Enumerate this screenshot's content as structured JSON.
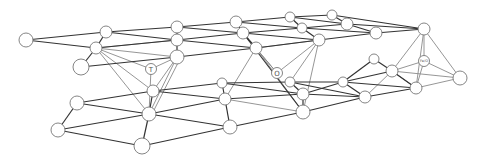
{
  "diagram": {
    "type": "3d-lattice-graph",
    "colors": {
      "background": "#ffffff",
      "edge_dark": "#333333",
      "edge_light": "#8a8a8a",
      "node_stroke": "#777777",
      "node_fill": "#ffffff"
    },
    "labels": {
      "node_T": "T",
      "node_O": "O",
      "node_right": "Fe/O"
    },
    "nodes": [
      {
        "id": "u1",
        "x": 26,
        "y": 40,
        "r": 7
      },
      {
        "id": "u2",
        "x": 106,
        "y": 32,
        "r": 6
      },
      {
        "id": "u3",
        "x": 96,
        "y": 48,
        "r": 6
      },
      {
        "id": "u4",
        "x": 81,
        "y": 67,
        "r": 8
      },
      {
        "id": "u5",
        "x": 177,
        "y": 27,
        "r": 6
      },
      {
        "id": "u6",
        "x": 177,
        "y": 40,
        "r": 6
      },
      {
        "id": "u7",
        "x": 177,
        "y": 57,
        "r": 7
      },
      {
        "id": "u8",
        "x": 236,
        "y": 22,
        "r": 6
      },
      {
        "id": "u9",
        "x": 243,
        "y": 33,
        "r": 6
      },
      {
        "id": "u10",
        "x": 256,
        "y": 48,
        "r": 6
      },
      {
        "id": "u11",
        "x": 290,
        "y": 17,
        "r": 5
      },
      {
        "id": "u12",
        "x": 303,
        "y": 17,
        "r": 5
      },
      {
        "id": "u13",
        "x": 302,
        "y": 28,
        "r": 5
      },
      {
        "id": "u14",
        "x": 319,
        "y": 40,
        "r": 6
      },
      {
        "id": "u15",
        "x": 332,
        "y": 15,
        "r": 5
      },
      {
        "id": "u16",
        "x": 347,
        "y": 24,
        "r": 6
      },
      {
        "id": "u17",
        "x": 376,
        "y": 33,
        "r": 6
      },
      {
        "id": "u18",
        "x": 424,
        "y": 29,
        "r": 6
      },
      {
        "id": "T",
        "x": 151,
        "y": 69,
        "r": 5,
        "label_key": "node_T"
      },
      {
        "id": "O",
        "x": 277,
        "y": 73,
        "r": 5,
        "label_key": "node_O"
      },
      {
        "id": "R",
        "x": 424,
        "y": 61,
        "r": 5,
        "label_key": "node_right"
      },
      {
        "id": "l1",
        "x": 77,
        "y": 103,
        "r": 7
      },
      {
        "id": "l2",
        "x": 58,
        "y": 130,
        "r": 7
      },
      {
        "id": "l3",
        "x": 153,
        "y": 91,
        "r": 6
      },
      {
        "id": "l4",
        "x": 149,
        "y": 114,
        "r": 7
      },
      {
        "id": "l5",
        "x": 142,
        "y": 146,
        "r": 8
      },
      {
        "id": "l6",
        "x": 222,
        "y": 83,
        "r": 5
      },
      {
        "id": "l7",
        "x": 225,
        "y": 99,
        "r": 6
      },
      {
        "id": "l8",
        "x": 230,
        "y": 127,
        "r": 7
      },
      {
        "id": "l9",
        "x": 290,
        "y": 82,
        "r": 5
      },
      {
        "id": "l10",
        "x": 303,
        "y": 94,
        "r": 6
      },
      {
        "id": "l11",
        "x": 303,
        "y": 112,
        "r": 7
      },
      {
        "id": "l12",
        "x": 343,
        "y": 82,
        "r": 5
      },
      {
        "id": "l13",
        "x": 365,
        "y": 97,
        "r": 6
      },
      {
        "id": "l14",
        "x": 374,
        "y": 59,
        "r": 5
      },
      {
        "id": "l15",
        "x": 392,
        "y": 71,
        "r": 6
      },
      {
        "id": "l16",
        "x": 416,
        "y": 88,
        "r": 6
      },
      {
        "id": "l17",
        "x": 460,
        "y": 78,
        "r": 7
      }
    ]
  }
}
